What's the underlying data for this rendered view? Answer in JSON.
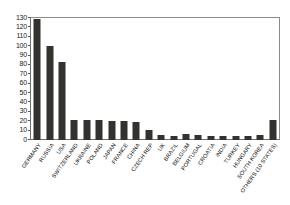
{
  "chart_data": {
    "type": "bar",
    "title": "",
    "subtitle": "",
    "xlabel": "",
    "ylabel": "",
    "ylim": [
      0,
      130
    ],
    "ytick_step": 10,
    "grid": false,
    "legend": false,
    "bar_color": "#33322f",
    "axis_color": "#6e6e6e",
    "categories": [
      "GERMANY",
      "RUSSIA",
      "USA",
      "SWITZERLAND",
      "UKRAINE",
      "POLAND",
      "JAPAN",
      "FRANCE",
      "CHINA",
      "CZECH REP",
      "UK",
      "BRAZIL",
      "BELGIUM",
      "PORTUGAL",
      "CROATIA",
      "INDIA",
      "TURKEY",
      "HUNGARY",
      "SOUTH KOREA",
      "OTHERS (10 STATES)"
    ],
    "values": [
      129,
      100,
      83,
      21,
      21,
      21,
      20,
      20,
      19,
      11,
      5,
      4,
      6,
      5,
      4,
      4,
      4,
      4,
      5,
      21
    ],
    "ytick_labels": [
      "130",
      "120",
      "110",
      "100",
      "90",
      "80",
      "70",
      "60",
      "50",
      "40",
      "30",
      "20",
      "10",
      "0"
    ],
    "ytick_values": [
      130,
      120,
      110,
      100,
      90,
      80,
      70,
      60,
      50,
      40,
      30,
      20,
      10,
      0
    ]
  }
}
